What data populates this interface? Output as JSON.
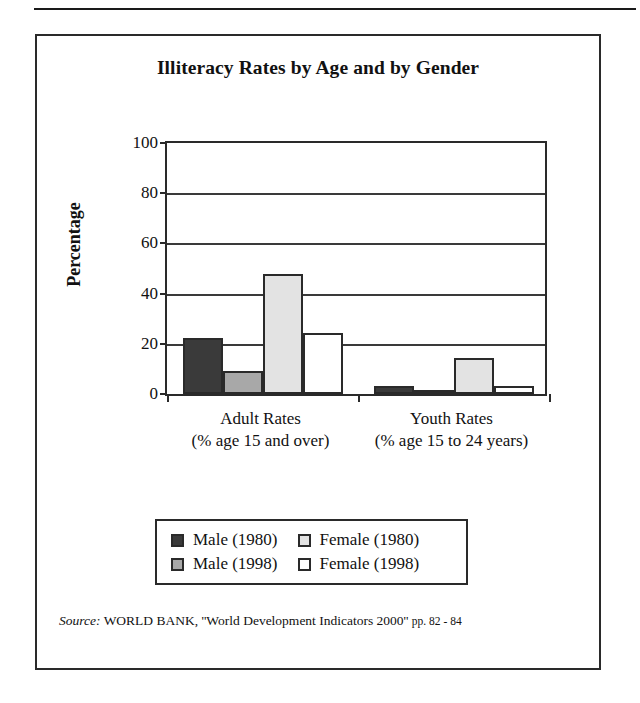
{
  "figure": {
    "title": "Illiteracy Rates by Age and by Gender",
    "source_label": "Source:",
    "source_text": "WORLD BANK, ''World Development Indicators 2000''",
    "source_pages": "pp. 82 - 84"
  },
  "chart_data": {
    "type": "bar",
    "title": "Illiteracy Rates by Age and by Gender",
    "xlabel": "",
    "ylabel": "Percentage",
    "ylim": [
      0,
      100
    ],
    "yticks": [
      0,
      20,
      40,
      60,
      80,
      100
    ],
    "ytick_labels": [
      "0",
      "20",
      "40",
      "60",
      "80",
      "100"
    ],
    "grid": true,
    "legend_position": "below-plot",
    "categories": [
      "Adult Rates",
      "Youth Rates"
    ],
    "category_sublabels": [
      "(% age 15 and over)",
      "(% age 15 to 24 years)"
    ],
    "series": [
      {
        "name": "Male (1980)",
        "color": "#3a3a3a",
        "values": [
          22,
          3
        ]
      },
      {
        "name": "Male (1998)",
        "color": "#a8a8a8",
        "values": [
          9,
          1
        ]
      },
      {
        "name": "Female (1980)",
        "color": "#e3e3e3",
        "values": [
          47,
          14
        ]
      },
      {
        "name": "Female (1998)",
        "color": "#ffffff",
        "values": [
          24,
          3
        ]
      }
    ]
  }
}
